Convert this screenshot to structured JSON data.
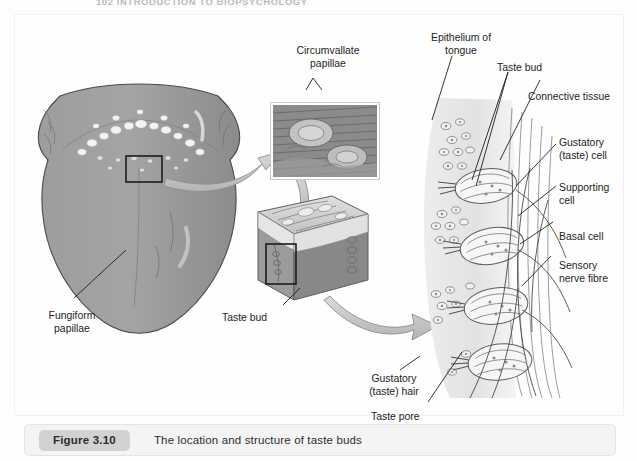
{
  "page": {
    "running_head": "102   INTRODUCTION TO BIOPSYCHOLOGY",
    "background_color": "#fdfdfd"
  },
  "caption": {
    "badge": "Figure 3.10",
    "text": "The location and structure of taste buds",
    "badge_color": "#d2d2d2",
    "bar_color": "#f4f4f4"
  },
  "figure": {
    "title": "The location and structure of taste buds",
    "panels": [
      {
        "name": "tongue-dorsal-view",
        "description": "Dorsal surface view of the human tongue, grey shaded, with white papillae dots arranged in a V along the sulcus terminalis; a black rectangle marks the magnified region."
      },
      {
        "name": "circumvallate-inset-photo",
        "description": "Dark hatched micrograph-style inset showing two circumvallate papillae."
      },
      {
        "name": "tongue-tissue-block",
        "description": "Three-dimensional cut-away block of tongue epithelium with a trench and a black rectangle marking one taste bud."
      },
      {
        "name": "taste-bud-detail",
        "description": "Enlarged vertical section of epithelium containing four taste buds with gustatory cells, supporting cells, basal cells and sensory nerve fibres."
      }
    ]
  },
  "labels": {
    "circumvallate_papillae": "Circumvallate\npapillae",
    "fungiform_papillae": "Fungiform\npapillae",
    "taste_bud_block": "Taste bud",
    "epithelium_of_tongue": "Epithelium of\ntongue",
    "taste_bud_detail": "Taste bud",
    "connective_tissue": "Connective tissue",
    "gustatory_taste_cell": "Gustatory\n(taste) cell",
    "supporting_cell": "Supporting\ncell",
    "basal_cell": "Basal cell",
    "sensory_nerve_fibre": "Sensory\nnerve fibre",
    "gustatory_taste_hair": "Gustatory\n(taste) hair",
    "taste_pore": "Taste pore"
  },
  "colors": {
    "tongue_fill": "#9a9a9a",
    "tongue_shadow": "#828282",
    "papilla_dot": "#f2f2f2",
    "inset_dark": "#7c7c7c",
    "block_top": "#d8d8d8",
    "block_side": "#8f8f8f",
    "tissue_pale": "#e3e3e3",
    "arrow_fill": "#c6c6c6",
    "line": "#3a3a3a",
    "label_text": "#1d1d1d"
  }
}
